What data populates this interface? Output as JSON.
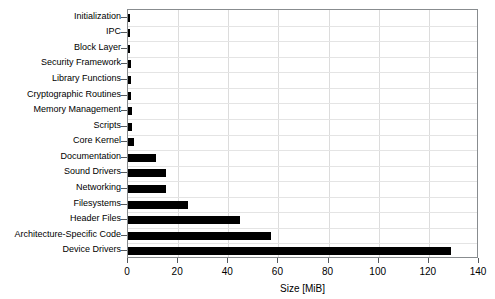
{
  "chart_data": {
    "type": "bar",
    "orientation": "horizontal",
    "title": "",
    "xlabel": "Size [MiB]",
    "ylabel": "",
    "xlim": [
      0,
      140
    ],
    "ylim": null,
    "grid": true,
    "legend": null,
    "xticks": [
      0,
      20,
      40,
      60,
      80,
      100,
      120,
      140
    ],
    "xticklabels": [
      "0",
      "20",
      "40",
      "60",
      "80",
      "100",
      "120",
      "140"
    ],
    "categories": [
      "Initialization",
      "IPC",
      "Block Layer",
      "Security Framework",
      "Library Functions",
      "Cryptographic Routines",
      "Memory Management",
      "Scripts",
      "Core Kernel",
      "Documentation",
      "Sound Drivers",
      "Networking",
      "Filesystems",
      "Header Files",
      "Architecture-Specific Code",
      "Device Drivers"
    ],
    "values": [
      0.3,
      0.4,
      0.6,
      1.1,
      1.2,
      1.3,
      1.4,
      1.6,
      2.4,
      11.0,
      15.0,
      15.0,
      24.0,
      44.5,
      57.0,
      129.0
    ],
    "bar_color": "#000000"
  }
}
